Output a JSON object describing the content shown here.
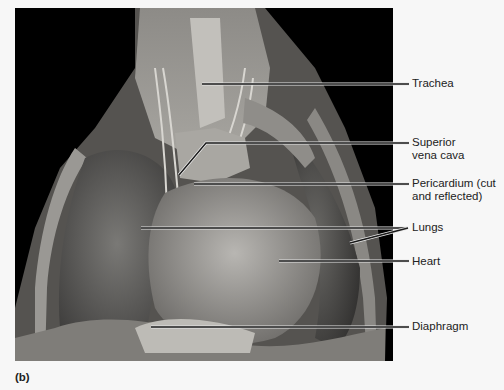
{
  "figure": {
    "panel_label": "(b)",
    "photo_description": "Cadaver dissection of thoracic cavity, anterior view",
    "labels": [
      {
        "id": "trachea",
        "text": "Trachea"
      },
      {
        "id": "superior-vena-cava",
        "text": "Superior\nvena cava"
      },
      {
        "id": "pericardium",
        "text": "Pericardium (cut\nand reflected)"
      },
      {
        "id": "lungs",
        "text": "Lungs"
      },
      {
        "id": "heart",
        "text": "Heart"
      },
      {
        "id": "diaphragm",
        "text": "Diaphragm"
      }
    ]
  },
  "colors": {
    "background": "#f7f7f7",
    "photo_bg": "#000000",
    "leader_line": "#1a1a1a",
    "leader_highlight": "#e8e8e8",
    "label_text": "#222222"
  }
}
